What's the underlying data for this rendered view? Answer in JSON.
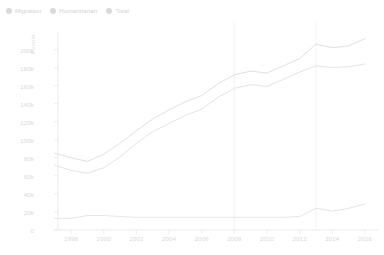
{
  "legend": {
    "position": "top-left",
    "items": [
      {
        "label": "Migration",
        "color": "#d9d9d9",
        "icon": "legend-dot-icon"
      },
      {
        "label": "Humanitarian",
        "color": "#d9d9d9",
        "icon": "legend-dot-icon"
      },
      {
        "label": "Total",
        "color": "#d9d9d9",
        "icon": "legend-dot-icon"
      }
    ]
  },
  "axes": {
    "ylabel": "People",
    "yticks": [
      "0",
      "20k",
      "40k",
      "60k",
      "80k",
      "100k",
      "120k",
      "140k",
      "160k",
      "180k",
      "200k"
    ],
    "xticks": [
      "1998",
      "2000",
      "2002",
      "2004",
      "2006",
      "2008",
      "2010",
      "2012",
      "2014",
      "2016"
    ]
  },
  "annotations": [
    {
      "name": "marker-2008",
      "label": "",
      "x_year": 2008
    },
    {
      "name": "marker-2013",
      "label": "",
      "x_year": 2013
    }
  ],
  "chart_data": {
    "type": "line",
    "title": "",
    "xlabel": "",
    "ylabel": "People",
    "xlim": [
      1997.2,
      2016.8
    ],
    "ylim": [
      0,
      215000
    ],
    "grid": false,
    "legend_position": "top-left",
    "x": [
      1997,
      1998,
      1999,
      2000,
      2001,
      2002,
      2003,
      2004,
      2005,
      2006,
      2007,
      2008,
      2009,
      2010,
      2011,
      2012,
      2013,
      2014,
      2015,
      2016
    ],
    "series": [
      {
        "name": "Total",
        "color": "#dcdcdc",
        "values": [
          85000,
          80000,
          76000,
          84000,
          96000,
          110000,
          123000,
          133000,
          142000,
          149000,
          162000,
          172000,
          176000,
          174000,
          182000,
          190000,
          206000,
          202000,
          204000,
          212000
        ]
      },
      {
        "name": "Migration",
        "color": "#e0e0e0",
        "values": [
          72000,
          66000,
          63000,
          69000,
          81000,
          96000,
          109000,
          118000,
          127000,
          134000,
          147000,
          157000,
          161000,
          159000,
          167000,
          175000,
          182000,
          180000,
          181000,
          184000
        ]
      },
      {
        "name": "Humanitarian",
        "color": "#e2e2e2",
        "values": [
          13000,
          13000,
          16000,
          16000,
          15000,
          14000,
          14000,
          14000,
          14000,
          14000,
          14000,
          14000,
          14000,
          14000,
          14000,
          15000,
          24000,
          21000,
          24000,
          29000
        ]
      }
    ]
  },
  "style": {
    "background": "#ffffff",
    "axis_color": "#e6e6e6",
    "tick_text_color": "#d8d8d8",
    "marker_line_color": "#f0f0f0"
  }
}
